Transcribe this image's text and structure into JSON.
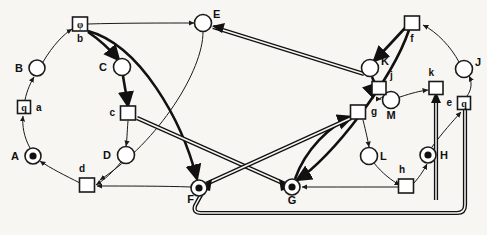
{
  "diagram": {
    "canvas": {
      "width": 487,
      "height": 235
    },
    "colors": {
      "background": "#f7f6f3",
      "stroke": "#1a1a1a",
      "token": "#111111",
      "node_fill": "#ffffff"
    },
    "places": [
      {
        "id": "A",
        "label": "A",
        "x": 33,
        "y": 156,
        "r": 8,
        "token": true,
        "label_dx": -14,
        "label_dy": 4
      },
      {
        "id": "B",
        "label": "B",
        "x": 37,
        "y": 68,
        "r": 8,
        "token": false,
        "label_dx": -14,
        "label_dy": 4
      },
      {
        "id": "C",
        "label": "C",
        "x": 122,
        "y": 67,
        "r": 8.5,
        "token": false,
        "label_dx": -15,
        "label_dy": 4
      },
      {
        "id": "D",
        "label": "D",
        "x": 126,
        "y": 155,
        "r": 8.5,
        "token": false,
        "label_dx": -15,
        "label_dy": 4
      },
      {
        "id": "E",
        "label": "E",
        "x": 203,
        "y": 23,
        "r": 8.5,
        "token": false,
        "label_dx": 10,
        "label_dy": -5
      },
      {
        "id": "F",
        "label": "F",
        "x": 199,
        "y": 188,
        "r": 8,
        "token": true,
        "label_dx": -5,
        "label_dy": 15
      },
      {
        "id": "G",
        "label": "G",
        "x": 292,
        "y": 187,
        "r": 8,
        "token": true,
        "label_dx": 0,
        "label_dy": 17
      },
      {
        "id": "H",
        "label": "H",
        "x": 428,
        "y": 155,
        "r": 8,
        "token": true,
        "label_dx": 12,
        "label_dy": 4
      },
      {
        "id": "J",
        "label": "J",
        "x": 464,
        "y": 69,
        "r": 8.5,
        "token": false,
        "label_dx": 11,
        "label_dy": -3
      },
      {
        "id": "K",
        "label": "K",
        "x": 370,
        "y": 68,
        "r": 8.5,
        "token": false,
        "label_dx": 11,
        "label_dy": -3
      },
      {
        "id": "L",
        "label": "L",
        "x": 369,
        "y": 156,
        "r": 8.5,
        "token": false,
        "label_dx": 11,
        "label_dy": 4
      },
      {
        "id": "M",
        "label": "M",
        "x": 391,
        "y": 100,
        "r": 8.5,
        "token": false,
        "label_dx": 0,
        "label_dy": 19
      }
    ],
    "transitions": [
      {
        "id": "a",
        "label": "a",
        "x": 24,
        "y": 107,
        "w": 13,
        "h": 13,
        "glyph": "q",
        "label_dx": 12,
        "label_dy": 4
      },
      {
        "id": "b",
        "label": "b",
        "x": 80,
        "y": 24,
        "w": 15,
        "h": 14,
        "glyph": "φ",
        "label_dx": 0,
        "label_dy": 18
      },
      {
        "id": "c",
        "label": "c",
        "x": 128,
        "y": 113,
        "w": 15,
        "h": 14,
        "glyph": "",
        "label_dx": -13,
        "label_dy": 3
      },
      {
        "id": "d",
        "label": "d",
        "x": 87,
        "y": 185,
        "w": 15,
        "h": 14,
        "glyph": "",
        "label_dx": -2,
        "label_dy": -13
      },
      {
        "id": "e",
        "label": "e",
        "x": 464,
        "y": 103,
        "w": 13,
        "h": 13,
        "glyph": "q",
        "label_dx": -12,
        "label_dy": 3
      },
      {
        "id": "f",
        "label": "f",
        "x": 412,
        "y": 23,
        "w": 15,
        "h": 14,
        "glyph": "",
        "label_dx": 0,
        "label_dy": 19
      },
      {
        "id": "g",
        "label": "g",
        "x": 358,
        "y": 112,
        "w": 15,
        "h": 14,
        "glyph": "",
        "label_dx": 13,
        "label_dy": 3
      },
      {
        "id": "h",
        "label": "h",
        "x": 406,
        "y": 186,
        "w": 15,
        "h": 14,
        "glyph": "",
        "label_dx": -1,
        "label_dy": -13
      },
      {
        "id": "j",
        "label": "j",
        "x": 379,
        "y": 88,
        "w": 14,
        "h": 13,
        "glyph": "",
        "label_dx": 11,
        "label_dy": -9
      },
      {
        "id": "k",
        "label": "k",
        "x": 436,
        "y": 88,
        "w": 14,
        "h": 13,
        "glyph": "",
        "label_dx": -2,
        "label_dy": -12
      }
    ],
    "arcs": [
      {
        "from": "A",
        "to": "a",
        "weight": "thin"
      },
      {
        "from": "a",
        "to": "B",
        "weight": "thin"
      },
      {
        "from": "B",
        "to": "b",
        "weight": "thin"
      },
      {
        "from": "b",
        "to": "C",
        "weight": "bold"
      },
      {
        "from": "C",
        "to": "c",
        "weight": "bold"
      },
      {
        "from": "c",
        "to": "D",
        "weight": "thin"
      },
      {
        "from": "D",
        "to": "d",
        "weight": "thin"
      },
      {
        "from": "d",
        "to": "A",
        "weight": "thin"
      },
      {
        "from": "b",
        "to": "E",
        "weight": "thin"
      },
      {
        "from": "E",
        "to": "d",
        "weight": "thin"
      },
      {
        "from": "b",
        "to": "F",
        "weight": "bold"
      },
      {
        "from": "F",
        "to": "d",
        "weight": "thin"
      },
      {
        "from": "c",
        "to": "G",
        "weight": "double"
      },
      {
        "from": "g",
        "to": "F",
        "weight": "double"
      },
      {
        "from": "F",
        "to": "k",
        "weight": "double"
      },
      {
        "from": "K",
        "to": "E",
        "weight": "double"
      },
      {
        "from": "H",
        "to": "e",
        "weight": "thin"
      },
      {
        "from": "e",
        "to": "J",
        "weight": "thin"
      },
      {
        "from": "J",
        "to": "f",
        "weight": "thin"
      },
      {
        "from": "f",
        "to": "K",
        "weight": "bold"
      },
      {
        "from": "K",
        "to": "j",
        "weight": "bold"
      },
      {
        "from": "j",
        "to": "M",
        "weight": "thin"
      },
      {
        "from": "M",
        "to": "k",
        "weight": "thin"
      },
      {
        "from": "f",
        "to": "G",
        "weight": "bold"
      },
      {
        "from": "g",
        "to": "L",
        "weight": "thin"
      },
      {
        "from": "L",
        "to": "h",
        "weight": "thin"
      },
      {
        "from": "h",
        "to": "G",
        "weight": "thin"
      },
      {
        "from": "h",
        "to": "H",
        "weight": "thin"
      },
      {
        "from": "G",
        "to": "g",
        "weight": "bold"
      }
    ],
    "legend": {
      "place_name": "place-circle",
      "token_name": "token-dot",
      "transition_name": "transition-square"
    }
  }
}
